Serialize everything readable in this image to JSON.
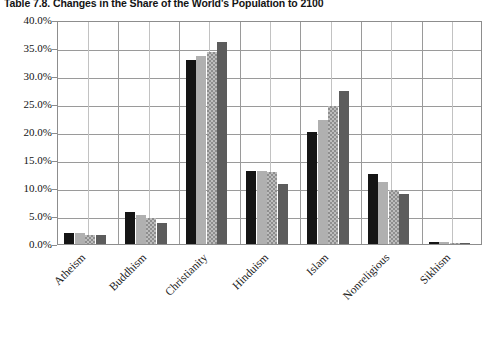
{
  "title": "Table 7.8.   Changes in the Share of the World's Population to 2100",
  "chart_data": {
    "type": "bar",
    "title": "Table 7.8.   Changes in the Share of the World's Population to 2100",
    "xlabel": "",
    "ylabel": "",
    "ylim": [
      0,
      40
    ],
    "yticks": [
      "0.0%",
      "5.0%",
      "10.0%",
      "15.0%",
      "20.0%",
      "25.0%",
      "30.0%",
      "35.0%",
      "40.0%"
    ],
    "ytick_values": [
      0,
      5,
      10,
      15,
      20,
      25,
      30,
      35,
      40
    ],
    "grid": true,
    "legend": "none",
    "categories": [
      "Atheism",
      "Buddhism",
      "Christianity",
      "Hinduism",
      "Islam",
      "Nonreligious",
      "Sikhism"
    ],
    "series": [
      {
        "name": "series-1",
        "fill": "solid-black",
        "color": "#151515",
        "values": [
          2.0,
          5.8,
          32.8,
          13.1,
          20.0,
          12.5,
          0.35
        ]
      },
      {
        "name": "series-2",
        "fill": "light-gray",
        "color": "#b0b0b0",
        "values": [
          1.9,
          5.1,
          33.5,
          13.0,
          22.2,
          11.0,
          0.3
        ]
      },
      {
        "name": "series-3",
        "fill": "checker-gray",
        "color": "#bdbdbd",
        "values": [
          1.6,
          4.6,
          34.2,
          12.9,
          24.6,
          9.6,
          0.25
        ]
      },
      {
        "name": "series-4",
        "fill": "dark-gray",
        "color": "#5c5c5c",
        "values": [
          1.6,
          3.7,
          36.1,
          10.8,
          27.4,
          9.0,
          0.25
        ]
      }
    ]
  }
}
